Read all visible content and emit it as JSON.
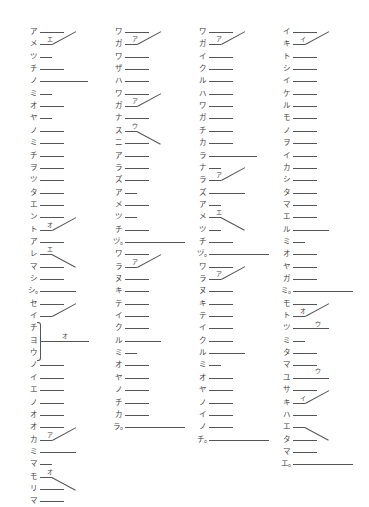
{
  "page": {
    "row_step": 12.35,
    "top": 32,
    "columns": [
      {
        "id": "col-1",
        "x": 28,
        "rows": [
          {
            "ch": "ア",
            "len": 24
          },
          {
            "ch": "メ",
            "len": 12
          },
          {
            "ch": "ツ",
            "len": 12
          },
          {
            "ch": "チ",
            "len": 24
          },
          {
            "ch": "ノ",
            "len": 48
          },
          {
            "ch": "ミ",
            "len": 12
          },
          {
            "ch": "オ",
            "len": 24
          },
          {
            "ch": "ヤ",
            "len": 12
          },
          {
            "ch": "ノ",
            "len": 24
          },
          {
            "ch": "ミ",
            "len": 24
          },
          {
            "ch": "チ",
            "len": 24
          },
          {
            "ch": "ヲ",
            "len": 24
          },
          {
            "ch": "ツ",
            "len": 24
          },
          {
            "ch": "タ",
            "len": 24
          },
          {
            "ch": "エ",
            "len": 24
          },
          {
            "ch": "ン",
            "len": 24
          },
          {
            "ch": "ト",
            "len": 12
          },
          {
            "ch": "ア",
            "len": 24
          },
          {
            "ch": "レ",
            "len": 12
          },
          {
            "ch": "マ",
            "len": 24
          },
          {
            "ch": "シ",
            "len": 24
          },
          {
            "ch": "シ。",
            "len": 36
          },
          {
            "ch": "セ",
            "len": 24
          },
          {
            "ch": "イ",
            "len": 12
          },
          {
            "ch": "チ",
            "len": 0
          },
          {
            "ch": "ヨ",
            "len": 0
          },
          {
            "ch": "ウ",
            "len": 0
          },
          {
            "ch": "ノ",
            "len": 24
          },
          {
            "ch": "イ",
            "len": 24
          },
          {
            "ch": "エ",
            "len": 24
          },
          {
            "ch": "ノ",
            "len": 24
          },
          {
            "ch": "オ",
            "len": 24
          },
          {
            "ch": "オ",
            "len": 24
          },
          {
            "ch": "カ",
            "len": 12
          },
          {
            "ch": "ミ",
            "len": 36
          },
          {
            "ch": "マ",
            "len": 12
          },
          {
            "ch": "モ",
            "len": 12
          },
          {
            "ch": "リ",
            "len": 24
          },
          {
            "ch": "マ",
            "len": 24
          }
        ],
        "links": [
          {
            "from": 0,
            "label": "エ",
            "dir": "up"
          },
          {
            "from": 15,
            "label": "オ",
            "dir": "up"
          },
          {
            "from": 18,
            "label": "エ",
            "dir": "down"
          },
          {
            "from": 22,
            "label": "",
            "dir": "up"
          },
          {
            "from": 32,
            "label": "ア",
            "dir": "up"
          },
          {
            "from": 36,
            "label": "オ",
            "dir": "down"
          }
        ],
        "brace": {
          "start": 24,
          "end": 26,
          "label": "オ",
          "len": 48
        }
      },
      {
        "id": "col-2",
        "x": 113,
        "rows": [
          {
            "ch": "ワ",
            "len": 24
          },
          {
            "ch": "ガ",
            "len": 12
          },
          {
            "ch": "ワ",
            "len": 24
          },
          {
            "ch": "ザ",
            "len": 24
          },
          {
            "ch": "ハ",
            "len": 24
          },
          {
            "ch": "ワ",
            "len": 24
          },
          {
            "ch": "ガ",
            "len": 12
          },
          {
            "ch": "ナ",
            "len": 24
          },
          {
            "ch": "ス",
            "len": 12
          },
          {
            "ch": "ニ",
            "len": 24
          },
          {
            "ch": "ア",
            "len": 24
          },
          {
            "ch": "ラ",
            "len": 24
          },
          {
            "ch": "ズ",
            "len": 24
          },
          {
            "ch": "ア",
            "len": 12
          },
          {
            "ch": "メ",
            "len": 24
          },
          {
            "ch": "ツ",
            "len": 12
          },
          {
            "ch": "チ",
            "len": 24
          },
          {
            "ch": "ヅ。",
            "len": 60
          },
          {
            "ch": "ワ",
            "len": 24
          },
          {
            "ch": "ラ",
            "len": 12
          },
          {
            "ch": "ヌ",
            "len": 24
          },
          {
            "ch": "キ",
            "len": 24
          },
          {
            "ch": "テ",
            "len": 24
          },
          {
            "ch": "イ",
            "len": 24
          },
          {
            "ch": "ク",
            "len": 24
          },
          {
            "ch": "ル",
            "len": 36
          },
          {
            "ch": "ミ",
            "len": 12
          },
          {
            "ch": "オ",
            "len": 24
          },
          {
            "ch": "ヤ",
            "len": 24
          },
          {
            "ch": "ノ",
            "len": 24
          },
          {
            "ch": "チ",
            "len": 24
          },
          {
            "ch": "カ",
            "len": 24
          },
          {
            "ch": "ラ。",
            "len": 60
          }
        ],
        "links": [
          {
            "from": 0,
            "label": "ア",
            "dir": "up"
          },
          {
            "from": 5,
            "label": "ア",
            "dir": "up"
          },
          {
            "from": 8,
            "label": "ウ",
            "dir": "down"
          },
          {
            "from": 18,
            "label": "ア",
            "dir": "up"
          }
        ]
      },
      {
        "id": "col-3",
        "x": 197,
        "rows": [
          {
            "ch": "ワ",
            "len": 24
          },
          {
            "ch": "ガ",
            "len": 12
          },
          {
            "ch": "イ",
            "len": 24
          },
          {
            "ch": "ク",
            "len": 24
          },
          {
            "ch": "ル",
            "len": 24
          },
          {
            "ch": "ハ",
            "len": 24
          },
          {
            "ch": "ワ",
            "len": 24
          },
          {
            "ch": "ガ",
            "len": 24
          },
          {
            "ch": "チ",
            "len": 24
          },
          {
            "ch": "カ",
            "len": 24
          },
          {
            "ch": "ラ",
            "len": 48
          },
          {
            "ch": "ナ",
            "len": 12
          },
          {
            "ch": "ラ",
            "len": 12
          },
          {
            "ch": "ズ",
            "len": 36
          },
          {
            "ch": "ア",
            "len": 12
          },
          {
            "ch": "メ",
            "len": 12
          },
          {
            "ch": "ツ",
            "len": 12
          },
          {
            "ch": "チ",
            "len": 24
          },
          {
            "ch": "ヅ。",
            "len": 60
          },
          {
            "ch": "ワ",
            "len": 24
          },
          {
            "ch": "ラ",
            "len": 12
          },
          {
            "ch": "ヌ",
            "len": 24
          },
          {
            "ch": "キ",
            "len": 24
          },
          {
            "ch": "テ",
            "len": 24
          },
          {
            "ch": "イ",
            "len": 24
          },
          {
            "ch": "ク",
            "len": 24
          },
          {
            "ch": "ル",
            "len": 36
          },
          {
            "ch": "ミ",
            "len": 12
          },
          {
            "ch": "オ",
            "len": 24
          },
          {
            "ch": "ヤ",
            "len": 24
          },
          {
            "ch": "ノ",
            "len": 24
          },
          {
            "ch": "イ",
            "len": 24
          },
          {
            "ch": "ノ",
            "len": 24
          },
          {
            "ch": "チ。",
            "len": 60
          }
        ],
        "links": [
          {
            "from": 0,
            "label": "ア",
            "dir": "up"
          },
          {
            "from": 11,
            "label": "ア",
            "dir": "up"
          },
          {
            "from": 15,
            "label": "エ",
            "dir": "down"
          },
          {
            "from": 19,
            "label": "ア",
            "dir": "up"
          }
        ]
      },
      {
        "id": "col-4",
        "x": 281,
        "rows": [
          {
            "ch": "イ",
            "len": 24
          },
          {
            "ch": "キ",
            "len": 12
          },
          {
            "ch": "ト",
            "len": 24
          },
          {
            "ch": "シ",
            "len": 24
          },
          {
            "ch": "イ",
            "len": 24
          },
          {
            "ch": "ケ",
            "len": 24
          },
          {
            "ch": "ル",
            "len": 24
          },
          {
            "ch": "モ",
            "len": 24
          },
          {
            "ch": "ノ",
            "len": 24
          },
          {
            "ch": "ヲ",
            "len": 24
          },
          {
            "ch": "イ",
            "len": 24
          },
          {
            "ch": "カ",
            "len": 24
          },
          {
            "ch": "シ",
            "len": 24
          },
          {
            "ch": "タ",
            "len": 24
          },
          {
            "ch": "マ",
            "len": 24
          },
          {
            "ch": "エ",
            "len": 24
          },
          {
            "ch": "ル",
            "len": 36
          },
          {
            "ch": "ミ",
            "len": 12
          },
          {
            "ch": "オ",
            "len": 24
          },
          {
            "ch": "ヤ",
            "len": 24
          },
          {
            "ch": "ガ",
            "len": 24
          },
          {
            "ch": "ミ。",
            "len": 60
          },
          {
            "ch": "モ",
            "len": 24
          },
          {
            "ch": "ト",
            "len": 12
          },
          {
            "ch": "ツ",
            "len": 36
          },
          {
            "ch": "ミ",
            "len": 12
          },
          {
            "ch": "タ",
            "len": 24
          },
          {
            "ch": "マ",
            "len": 24
          },
          {
            "ch": "ユ",
            "len": 36
          },
          {
            "ch": "サ",
            "len": 24
          },
          {
            "ch": "キ",
            "len": 12
          },
          {
            "ch": "ハ",
            "len": 24
          },
          {
            "ch": "エ",
            "len": 12
          },
          {
            "ch": "タ",
            "len": 24
          },
          {
            "ch": "マ",
            "len": 24
          },
          {
            "ch": "エ。",
            "len": 60
          }
        ],
        "links": [
          {
            "from": 0,
            "label": "イ",
            "dir": "up"
          },
          {
            "from": 22,
            "label": "オ",
            "dir": "up"
          },
          {
            "from": 29,
            "label": "イ",
            "dir": "up"
          },
          {
            "from": 32,
            "label": "",
            "dir": "down"
          }
        ],
        "marks": [
          {
            "row": 24,
            "label": "ウ",
            "offset": 22
          },
          {
            "row": 27,
            "label": "ウ",
            "offset": 22
          }
        ]
      }
    ]
  }
}
